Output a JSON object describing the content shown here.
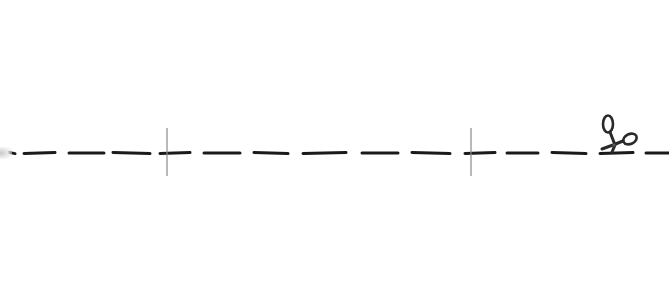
{
  "scene": {
    "description": "Dashed cut line with scissors icon",
    "colors": {
      "background": "#ffffff",
      "dash": "#1a1a1a",
      "guide_line": "#8a8a8a",
      "scissors_stroke": "#2a2a2a",
      "scissors_fill": "#5a5a5a"
    },
    "dash_count": 15,
    "guide_count": 2,
    "icon": "scissors-icon"
  }
}
